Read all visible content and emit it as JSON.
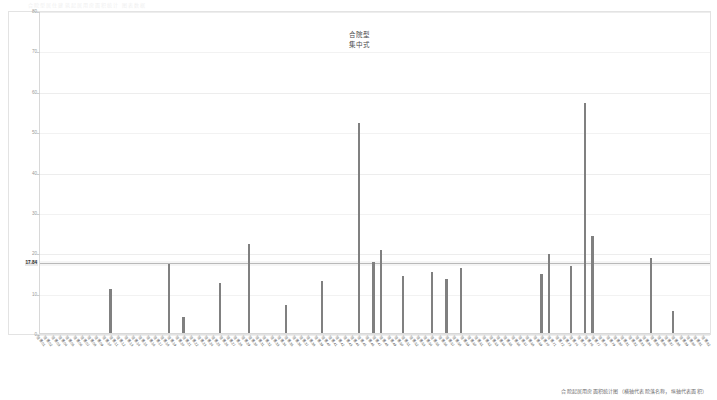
{
  "header": {
    "text": "合院型居住建筑起居用房面积统计  图表数据"
  },
  "chart_title": {
    "line1": "合院型",
    "line2": "集中式"
  },
  "caption": {
    "text": "合院起居用房面积统计图（横轴代表院落名称，纵轴代表面积）"
  },
  "axis": {
    "y_ticks": [
      "80",
      "70",
      "60",
      "50",
      "40",
      "30",
      "20",
      "10",
      "0"
    ],
    "reference_label": "17.84"
  },
  "chart_data": {
    "type": "bar",
    "title": "合院型 集中式",
    "xlabel": "院落名称",
    "ylabel": "面积",
    "ylim": [
      0,
      80
    ],
    "grid": true,
    "legend": "none",
    "bar_color": "#808080",
    "reference_line": {
      "value": 17.84,
      "label": "17.84",
      "color": "#b9b9b9"
    },
    "n_categories": 92,
    "categories": [
      "院落01",
      "院落02",
      "院落03",
      "院落04",
      "院落05",
      "院落06",
      "院落07",
      "院落08",
      "院落09",
      "院落10",
      "院落11",
      "院落12",
      "院落13",
      "院落14",
      "院落15",
      "院落16",
      "院落17",
      "院落18",
      "院落19",
      "院落20",
      "院落21",
      "院落22",
      "院落23",
      "院落24",
      "院落25",
      "院落26",
      "院落27",
      "院落28",
      "院落29",
      "院落30",
      "院落31",
      "院落32",
      "院落33",
      "院落34",
      "院落35",
      "院落36",
      "院落37",
      "院落38",
      "院落39",
      "院落40",
      "院落41",
      "院落42",
      "院落43",
      "院落44",
      "院落45",
      "院落46",
      "院落47",
      "院落48",
      "院落49",
      "院落50",
      "院落51",
      "院落52",
      "院落53",
      "院落54",
      "院落55",
      "院落56",
      "院落57",
      "院落58",
      "院落59",
      "院落60",
      "院落61",
      "院落62",
      "院落63",
      "院落64",
      "院落65",
      "院落66",
      "院落67",
      "院落68",
      "院落69",
      "院落70",
      "院落71",
      "院落72",
      "院落73",
      "院落74",
      "院落75",
      "院落76",
      "院落77",
      "院落78",
      "院落79",
      "院落80",
      "院落81",
      "院落82",
      "院落83",
      "院落84",
      "院落85",
      "院落86",
      "院落87",
      "院落88",
      "院落89",
      "院落90",
      "院落91",
      "院落92"
    ],
    "values": [
      0,
      0,
      0,
      0,
      0,
      0,
      0,
      0,
      0,
      11.0,
      0,
      0,
      0,
      0,
      0,
      0,
      0,
      17.0,
      0,
      4.0,
      0,
      0,
      0,
      0,
      12.5,
      0,
      0,
      0,
      22.0,
      0,
      0,
      0,
      0,
      7.0,
      0,
      0,
      0,
      0,
      13.0,
      0,
      0,
      0,
      0,
      52.0,
      0,
      17.5,
      20.5,
      0,
      0,
      14.0,
      0,
      0,
      0,
      15.0,
      0,
      13.5,
      0,
      16.0,
      0,
      0,
      0,
      0,
      0,
      0,
      0,
      0,
      0,
      0,
      14.5,
      19.5,
      0,
      0,
      16.5,
      0,
      57.0,
      24.0,
      0,
      0,
      0,
      0,
      0,
      0,
      0,
      18.5,
      0,
      0,
      5.5,
      0,
      0,
      0,
      0,
      0
    ]
  }
}
